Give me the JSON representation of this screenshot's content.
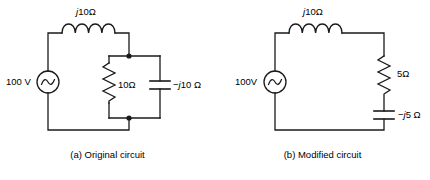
{
  "figure": {
    "background_color": "#ffffff",
    "line_color": "#1a1a1a"
  },
  "circuits": [
    {
      "id": "original",
      "caption": "(a) Original circuit",
      "source": {
        "label": "100 V",
        "symbol": "ac-voltage-source"
      },
      "components": [
        {
          "name": "inductor",
          "label_prefix": "j",
          "label_value": "10Ω",
          "label_full": "j10Ω"
        },
        {
          "name": "resistor",
          "label_prefix": "",
          "label_value": "10Ω",
          "label_full": "10Ω"
        },
        {
          "name": "capacitor",
          "label_prefix": "−j",
          "label_value": "10 Ω",
          "label_full": "−j10 Ω"
        }
      ],
      "topology": "source in series with inductor, feeding parallel resistor and capacitor branches"
    },
    {
      "id": "modified",
      "caption": "(b) Modified circuit",
      "source": {
        "label": "100V",
        "symbol": "ac-voltage-source"
      },
      "components": [
        {
          "name": "inductor",
          "label_prefix": "j",
          "label_value": "10Ω",
          "label_full": "j10Ω"
        },
        {
          "name": "resistor",
          "label_prefix": "",
          "label_value": "5Ω",
          "label_full": "5Ω"
        },
        {
          "name": "capacitor",
          "label_prefix": "−j",
          "label_value": "5 Ω",
          "label_full": "−j5 Ω"
        }
      ],
      "topology": "single series loop: source, inductor, resistor, capacitor"
    }
  ]
}
